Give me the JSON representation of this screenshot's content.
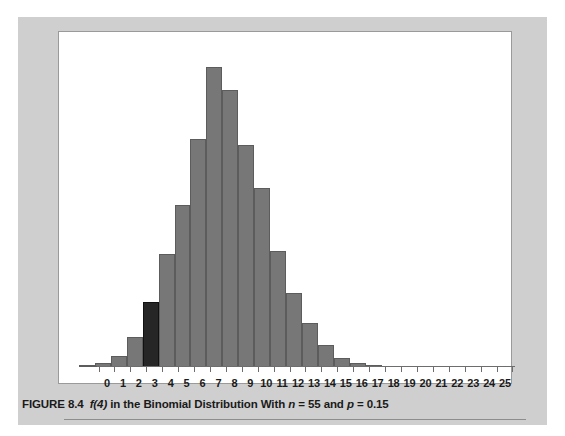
{
  "figure": {
    "caption_prefix": "FIGURE 8.4",
    "caption_fx": "f(4)",
    "caption_mid": "in the Binomial Distribution With",
    "caption_n_var": "n",
    "caption_n_val": "= 55 and",
    "caption_p_var": "p",
    "caption_p_val": "= 0.15",
    "caption_full": "FIGURE 8.4  f(4) in the Binomial Distribution With n = 55 and p = 0.15"
  },
  "colors": {
    "panel_background": "#cfcfcf",
    "plot_background": "#ffffff",
    "bar_fill": "#777777",
    "bar_edge": "#5c5c5c",
    "highlight_fill": "#262626",
    "axis": "#6d6d6d",
    "text": "#1a1a1a"
  },
  "chart_data": {
    "type": "bar",
    "title": "f(4) in the Binomial Distribution With n = 55 and p = 0.15",
    "subtitle": "",
    "xlabel": "",
    "ylabel": "",
    "grid": false,
    "legend": "none",
    "distribution": "binomial",
    "parameters": {
      "n": 55,
      "p": 0.15
    },
    "highlight_category": "4",
    "highlight_note": "f(4) bar shaded black",
    "xlim": [
      -0.5,
      25.5
    ],
    "ylim": [
      0,
      0.15
    ],
    "categories": [
      "0",
      "1",
      "2",
      "3",
      "4",
      "5",
      "6",
      "7",
      "8",
      "9",
      "10",
      "11",
      "12",
      "13",
      "14",
      "15",
      "16",
      "17",
      "18",
      "19",
      "20",
      "21",
      "22",
      "23",
      "24",
      "25"
    ],
    "values": [
      0.0001,
      0.0013,
      0.006,
      0.0182,
      0.0401,
      0.0679,
      0.0939,
      0.1089,
      0.1116,
      0.1007,
      0.0818,
      0.0601,
      0.0402,
      0.0246,
      0.0139,
      0.0072,
      0.0035,
      0.0016,
      0.0006,
      0.0002,
      0.0001,
      0.0,
      0.0,
      0.0,
      0.0,
      0.0
    ],
    "bar_pixel_heights_pct": [
      0.6,
      1.2,
      3.6,
      9.4,
      20.6,
      35.8,
      51.0,
      72.0,
      94.5,
      87.5,
      70.0,
      56.5,
      36.5,
      23.5,
      14.0,
      7.0,
      3.0,
      1.2,
      0.6,
      0.4,
      0.4,
      0.4,
      0.4,
      0.4,
      0.4,
      0.4
    ],
    "tick_labels": [
      "0",
      "1",
      "2",
      "3",
      "4",
      "5",
      "6",
      "7",
      "8",
      "9",
      "10",
      "11",
      "12",
      "13",
      "14",
      "15",
      "16",
      "17",
      "18",
      "19",
      "20",
      "21",
      "22",
      "23",
      "24",
      "25"
    ]
  }
}
